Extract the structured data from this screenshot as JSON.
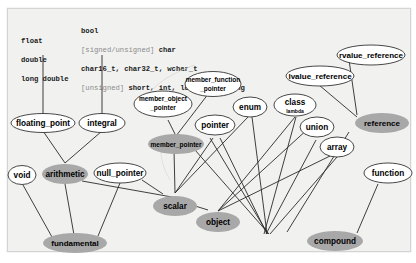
{
  "diagram": {
    "annotations": {
      "floating_types": [
        "float",
        "double",
        "long double"
      ],
      "integral_types": [
        {
          "prefix": "",
          "text": "bool"
        },
        {
          "prefix": "[signed/unsigned]",
          "text": " char"
        },
        {
          "prefix": "",
          "text": "char16_t, char32_t, wchar_t"
        },
        {
          "prefix": "[unsigned]",
          "text": " short, int, long, long long"
        }
      ]
    },
    "nodes": {
      "floating_point": {
        "label": "floating_point",
        "style": "leaf"
      },
      "integral": {
        "label": "integral",
        "style": "leaf"
      },
      "void": {
        "label": "void",
        "style": "leaf"
      },
      "arithmetic": {
        "label": "arithmetic",
        "style": "composite"
      },
      "null_pointer": {
        "label": "null_pointer",
        "style": "leaf"
      },
      "fundamental": {
        "label": "fundamental",
        "style": "composite"
      },
      "member_object_pointer": {
        "label_line1": "member_object",
        "label_line2": "_pointer",
        "style": "leaf"
      },
      "member_function_pointer": {
        "label_line1": "member_function",
        "label_line2": "_pointer",
        "style": "leaf"
      },
      "member_pointer": {
        "label": "member_pointer",
        "style": "composite"
      },
      "pointer": {
        "label": "pointer",
        "style": "leaf"
      },
      "enum": {
        "label": "enum",
        "style": "leaf"
      },
      "class": {
        "label": "class",
        "sublabel": "lambda",
        "style": "leaf"
      },
      "union": {
        "label": "union",
        "style": "leaf"
      },
      "array": {
        "label": "array",
        "style": "leaf"
      },
      "scalar": {
        "label": "scalar",
        "style": "composite"
      },
      "object": {
        "label": "object",
        "style": "composite"
      },
      "lvalue_reference": {
        "label": "lvalue_reference",
        "style": "leaf"
      },
      "rvalue_reference": {
        "label": "rvalue_reference",
        "style": "leaf"
      },
      "reference": {
        "label": "reference",
        "style": "composite"
      },
      "function": {
        "label": "function",
        "style": "leaf"
      },
      "compound": {
        "label": "compound",
        "style": "composite"
      }
    },
    "colors": {
      "leaf_fill": "#ffffff",
      "composite_fill": "#a8a8a8",
      "edge": "#2a2a2a",
      "background": "#f1f1f0"
    }
  }
}
